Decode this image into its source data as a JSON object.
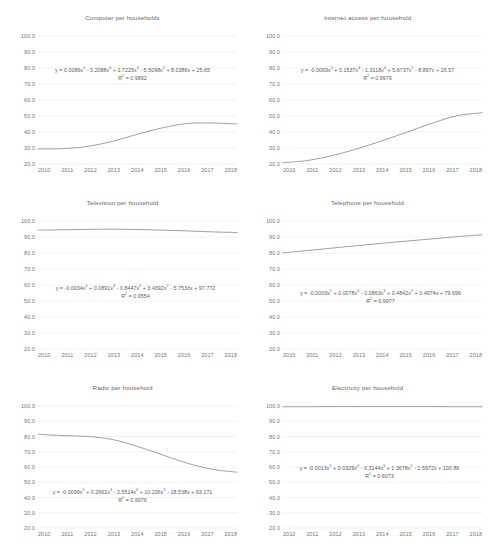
{
  "figure": {
    "layout": "2-columns x 3-rows grid of line charts",
    "shared_x_categories": [
      "2010",
      "2011",
      "2012",
      "2013",
      "2014",
      "2015",
      "2016",
      "2017",
      "2018"
    ],
    "shared_y_ticks": [
      "100.0",
      "90.0",
      "80.0",
      "70.0",
      "60.0",
      "50.0",
      "40.0",
      "30.0",
      "20.0"
    ],
    "line_color": "#8f8f8f",
    "gridline_color": "#e8e8e8",
    "text_color": "#737373"
  },
  "chart_data": [
    {
      "type": "line",
      "id": "computer",
      "title": "Computer per households",
      "xlabel": "",
      "ylabel": "",
      "ylim": [
        20.0,
        100.0
      ],
      "yticks": [
        100.0,
        90.0,
        80.0,
        70.0,
        60.0,
        50.0,
        40.0,
        30.0,
        20.0
      ],
      "categories": [
        "2010",
        "2011",
        "2012",
        "2013",
        "2014",
        "2015",
        "2016",
        "2017",
        "2018"
      ],
      "values": [
        29.4,
        29.6,
        31.0,
        34.2,
        38.6,
        42.6,
        45.3,
        45.6,
        45.0
      ],
      "grid": true,
      "legend": "none",
      "annotation_equation": "y = 0.0086x⁵ - 0.2088x⁴ + 1.7225x³ - 5.5098x² + 8.0386x + 25.65",
      "annotation_r2": "R² = 0.9892"
    },
    {
      "type": "line",
      "id": "internet",
      "title": "Internet access per household",
      "xlabel": "",
      "ylabel": "",
      "ylim": [
        20.0,
        100.0
      ],
      "yticks": [
        100.0,
        90.0,
        80.0,
        70.0,
        60.0,
        50.0,
        40.0,
        30.0,
        20.0
      ],
      "categories": [
        "2010",
        "2011",
        "2012",
        "2013",
        "2014",
        "2015",
        "2016",
        "2017",
        "2018"
      ],
      "values": [
        20.9,
        22.2,
        25.3,
        29.6,
        34.6,
        40.0,
        45.5,
        50.2,
        52.0
      ],
      "grid": true,
      "legend": "none",
      "annotation_equation": "y = -0.0069x⁵ + 0.1537x⁴ - 1.3118x³ + 5.6737x² - 8.897x + 26.57",
      "annotation_r2": "R² = 0.9979"
    },
    {
      "type": "line",
      "id": "television",
      "title": "Television per household",
      "xlabel": "",
      "ylabel": "",
      "ylim": [
        20.0,
        100.0
      ],
      "yticks": [
        100.0,
        90.0,
        80.0,
        70.0,
        60.0,
        50.0,
        40.0,
        30.0,
        20.0
      ],
      "categories": [
        "2010",
        "2011",
        "2012",
        "2013",
        "2014",
        "2015",
        "2016",
        "2017",
        "2018"
      ],
      "values": [
        94.3,
        94.5,
        94.8,
        94.9,
        94.7,
        94.3,
        93.8,
        93.2,
        92.8
      ],
      "grid": true,
      "legend": "none",
      "annotation_equation": "y = -0.0034x⁵ + 0.0891x⁴ - 0.8447x³ + 3.4392x² - 5.7533x + 97.772",
      "annotation_r2": "R² = 0.9554"
    },
    {
      "type": "line",
      "id": "telephone",
      "title": "Telephone per household",
      "xlabel": "",
      "ylabel": "",
      "ylim": [
        20.0,
        100.0
      ],
      "yticks": [
        100.0,
        90.0,
        80.0,
        70.0,
        60.0,
        50.0,
        40.0,
        30.0,
        20.0
      ],
      "categories": [
        "2010",
        "2011",
        "2012",
        "2013",
        "2014",
        "2015",
        "2016",
        "2017",
        "2018"
      ],
      "values": [
        80.1,
        81.6,
        83.1,
        84.6,
        86.1,
        87.5,
        88.8,
        90.2,
        91.4
      ],
      "grid": true,
      "legend": "none",
      "annotation_equation": "y = -0.0003x⁵ + 0.0078x⁴ - 0.0863x³ + 0.4842x² + 0.4974x + 79.696",
      "annotation_r2": "R² = 0.9977"
    },
    {
      "type": "line",
      "id": "radio",
      "title": "Radio per household",
      "xlabel": "",
      "ylabel": "",
      "ylim": [
        20.0,
        100.0
      ],
      "yticks": [
        100.0,
        90.0,
        80.0,
        70.0,
        60.0,
        50.0,
        40.0,
        30.0,
        20.0
      ],
      "categories": [
        "2010",
        "2011",
        "2012",
        "2013",
        "2014",
        "2015",
        "2016",
        "2017",
        "2018"
      ],
      "values": [
        81.5,
        80.6,
        80.0,
        78.0,
        73.5,
        68.0,
        62.5,
        58.5,
        56.6
      ],
      "grid": true,
      "legend": "none",
      "annotation_equation": "y = -0.0099x⁵ + 0.2662x⁴ - 2.5514x³ + 10.206x² - 18.538x + 93.271",
      "annotation_r2": "R² = 0.9976"
    },
    {
      "type": "line",
      "id": "electricity",
      "title": "Electricity per household",
      "xlabel": "",
      "ylabel": "",
      "ylim": [
        20.0,
        100.0
      ],
      "yticks": [
        100.0,
        90.0,
        80.0,
        70.0,
        60.0,
        50.0,
        40.0,
        30.0,
        20.0
      ],
      "categories": [
        "2010",
        "2011",
        "2012",
        "2013",
        "2014",
        "2015",
        "2016",
        "2017",
        "2018"
      ],
      "values": [
        99.5,
        99.5,
        99.6,
        99.6,
        99.6,
        99.6,
        99.6,
        99.5,
        99.5
      ],
      "grid": true,
      "legend": "none",
      "annotation_equation": "y = -0.0013x⁵ + 0.0329x⁴ - 0.3144x³ + 1.3678x² - 2.5972x + 100.86",
      "annotation_r2": "R² = 0.6073"
    }
  ]
}
